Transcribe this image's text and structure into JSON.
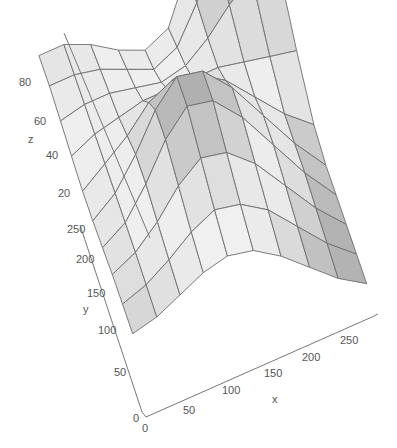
{
  "chart_data": {
    "type": "surface",
    "title": "",
    "xlabel": "x",
    "ylabel": "y",
    "zlabel": "z",
    "x_ticks": [
      0,
      50,
      100,
      150,
      200,
      250
    ],
    "y_ticks": [
      0,
      50,
      100,
      150,
      200,
      250
    ],
    "z_ticks": [
      20,
      40,
      60,
      80
    ],
    "xlim": [
      0,
      280
    ],
    "ylim": [
      0,
      280
    ],
    "zlim": [
      0,
      90
    ],
    "grid_size": [
      10,
      10
    ],
    "colormap": "gray",
    "x": [
      0,
      31,
      62,
      93,
      124,
      155,
      186,
      217,
      248,
      280
    ],
    "y": [
      0,
      31,
      62,
      93,
      124,
      155,
      186,
      217,
      248,
      280
    ],
    "z": [
      [
        30,
        32,
        36,
        40,
        42,
        40,
        34,
        26,
        18,
        12
      ],
      [
        32,
        35,
        40,
        46,
        50,
        48,
        42,
        32,
        22,
        14
      ],
      [
        34,
        38,
        45,
        54,
        60,
        58,
        50,
        38,
        26,
        16
      ],
      [
        35,
        40,
        50,
        62,
        70,
        68,
        58,
        44,
        30,
        18
      ],
      [
        36,
        42,
        52,
        64,
        72,
        70,
        60,
        46,
        32,
        20
      ],
      [
        38,
        44,
        50,
        58,
        62,
        60,
        54,
        44,
        34,
        26
      ],
      [
        42,
        46,
        48,
        50,
        50,
        50,
        50,
        48,
        46,
        44
      ],
      [
        46,
        48,
        48,
        46,
        44,
        46,
        52,
        60,
        66,
        70
      ],
      [
        50,
        50,
        48,
        44,
        40,
        44,
        56,
        70,
        80,
        86
      ],
      [
        52,
        52,
        48,
        42,
        38,
        42,
        58,
        74,
        86,
        92
      ]
    ]
  },
  "axes": {
    "x_label": "x",
    "y_label": "y",
    "z_label": "z",
    "x_tick_labels": [
      "0",
      "50",
      "100",
      "150",
      "200",
      "250"
    ],
    "y_tick_labels": [
      "0",
      "50",
      "100",
      "150",
      "200",
      "250"
    ],
    "z_tick_labels": [
      "20",
      "40",
      "60",
      "80"
    ]
  }
}
